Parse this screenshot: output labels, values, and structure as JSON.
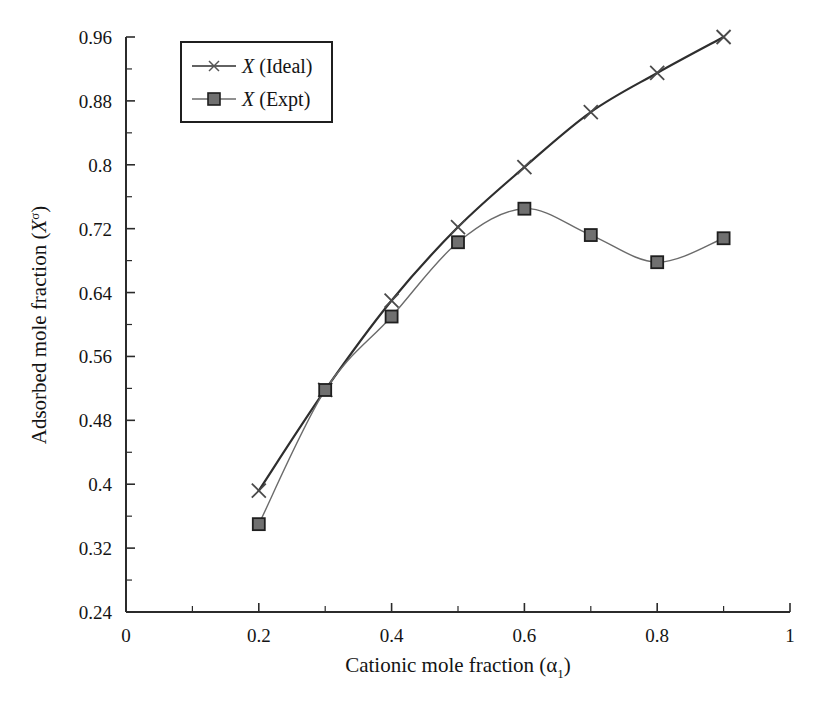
{
  "chart_data": {
    "type": "line",
    "title": "",
    "subtitle": "",
    "xlabel": "Cationic mole fraction (α₁)",
    "ylabel": "Adsorbed mole fraction (Xσ)",
    "xlabel_parts": {
      "text": "Cationic mole fraction (",
      "symbol": "α",
      "subscript": "1",
      "close": ")"
    },
    "ylabel_parts": {
      "text": "Adsorbed mole fraction (",
      "symbol": "X",
      "superscript": "σ",
      "close": ")"
    },
    "xlim": [
      0,
      1
    ],
    "ylim": [
      0.24,
      0.96
    ],
    "xticks": [
      0,
      0.2,
      0.4,
      0.6,
      0.8,
      1
    ],
    "xtick_labels": [
      "0",
      "0.2",
      "0.4",
      "0.6",
      "0.8",
      "1"
    ],
    "xminor_step": 0.1,
    "yticks": [
      0.24,
      0.32,
      0.4,
      0.48,
      0.56,
      0.64,
      0.72,
      0.8,
      0.88,
      0.96
    ],
    "ytick_labels": [
      "0.24",
      "0.32",
      "0.4",
      "0.48",
      "0.56",
      "0.64",
      "0.72",
      "0.8",
      "0.88",
      "0.96"
    ],
    "yminor_step": 0.04,
    "grid": false,
    "legend_position": "top-left-inside",
    "x": [
      0.2,
      0.3,
      0.4,
      0.5,
      0.6,
      0.7,
      0.8,
      0.9
    ],
    "series": [
      {
        "name": "X (Ideal)",
        "name_italic_part": "X",
        "name_rest": " (Ideal)",
        "marker": "x-cross",
        "color": "#2e2e2e",
        "line_width": 2.2,
        "values": [
          0.392,
          0.518,
          0.63,
          0.722,
          0.797,
          0.866,
          0.915,
          0.96
        ]
      },
      {
        "name": "X (Expt)",
        "name_italic_part": "X",
        "name_rest": " (Expt)",
        "marker": "square",
        "color": "#6b6b6b",
        "marker_fill": "#707070",
        "marker_edge": "#1f1f1f",
        "line_width": 1.4,
        "values": [
          0.35,
          0.518,
          0.61,
          0.703,
          0.745,
          0.712,
          0.678,
          0.708
        ]
      }
    ]
  },
  "legend": {
    "items": [
      {
        "label_italic": "X",
        "label_rest": " (Ideal)",
        "marker": "x-cross"
      },
      {
        "label_italic": "X",
        "label_rest": " (Expt)",
        "marker": "square"
      }
    ]
  },
  "axes": {
    "x_title_text": "Cationic mole fraction (",
    "x_title_alpha": "α",
    "x_title_sub": "1",
    "x_title_close": ")",
    "y_title_text": "Adsorbed mole fraction (",
    "y_title_X": "X",
    "y_title_sup": "σ",
    "y_title_close": ")"
  },
  "colors": {
    "background": "#ffffff",
    "axis": "#2b2b2b",
    "ideal_line": "#2e2e2e",
    "expt_line": "#6b6b6b",
    "expt_marker_fill": "#707070",
    "text": "#141414"
  }
}
